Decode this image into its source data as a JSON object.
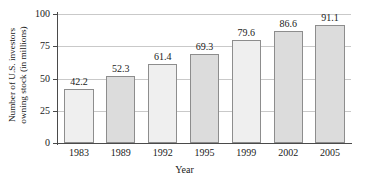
{
  "chart_data": {
    "type": "bar",
    "title": "",
    "xlabel": "Year",
    "ylabel_line1": "Number of U.S. investors",
    "ylabel_line2": "owning stock (in millions)",
    "categories": [
      "1983",
      "1989",
      "1992",
      "1995",
      "1999",
      "2002",
      "2005"
    ],
    "values": [
      42.2,
      52.3,
      61.4,
      69.3,
      79.6,
      86.6,
      91.1
    ],
    "value_labels": [
      "42.2",
      "52.3",
      "61.4",
      "69.3",
      "79.6",
      "86.6",
      "91.1"
    ],
    "ylim": [
      0,
      100
    ],
    "yticks": [
      0,
      25,
      50,
      75,
      100
    ],
    "ytick_labels": [
      "0",
      "25",
      "50",
      "75",
      "100"
    ],
    "grid": true,
    "grid_axis": "y",
    "legend": "none",
    "bar_colors": [
      "#efefef",
      "#dcdcdc",
      "#efefef",
      "#dcdcdc",
      "#efefef",
      "#dcdcdc",
      "#dcdcdc"
    ],
    "bar_edge_color": "#8d8d8d",
    "axis_color": "#4a4a4a",
    "grid_color": "#c9c9c9",
    "background": "#ffffff"
  }
}
